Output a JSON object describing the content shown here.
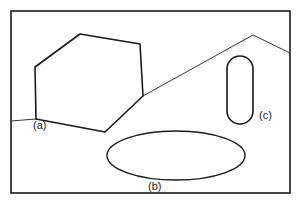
{
  "figure": {
    "kind": "line-drawing-scene",
    "background_color": "#ffffff",
    "ink_color": "#1a1a1a",
    "frame": {
      "name": "picture-frame-border",
      "x": 11,
      "y": 11,
      "width": 279,
      "height": 182,
      "stroke_width": 1.6,
      "color": "#1a1a1a"
    },
    "ground_line": {
      "name": "horizon-ground-polyline",
      "stroke_width": 1.0,
      "color": "#333333",
      "points": "11,121 36,119 143,96 253,35 290,53"
    },
    "shapes": [
      {
        "id": "a",
        "name": "hexagonal-block",
        "type": "polygon",
        "label": "(a)",
        "stroke_width": 1.6,
        "points": "35,67 80,34 140,44 143,96 105,132 36,119",
        "label_x": 33,
        "label_y": 120
      },
      {
        "id": "b",
        "name": "ground-ellipse",
        "type": "ellipse",
        "label": "(b)",
        "stroke_width": 1.4,
        "cx": 176,
        "cy": 155.5,
        "rx": 69,
        "ry": 24.5,
        "label_x": 148,
        "label_y": 181
      },
      {
        "id": "c",
        "name": "rounded-pillar",
        "type": "rounded-rectangle",
        "label": "(c)",
        "stroke_width": 1.6,
        "x": 227,
        "y": 56,
        "width": 26,
        "height": 68,
        "corner_radius": 13,
        "label_x": 259,
        "label_y": 110
      }
    ],
    "labels": {
      "a": "(a)",
      "b": "(b)",
      "c": "(c)"
    }
  }
}
